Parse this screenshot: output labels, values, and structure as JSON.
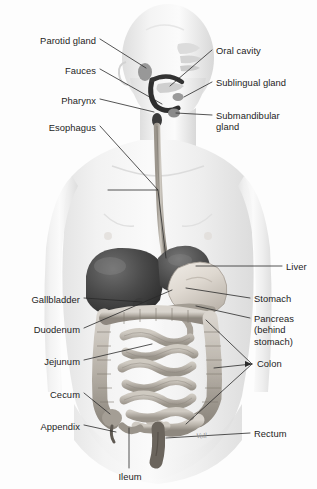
{
  "figure": {
    "artist_signature": "Voll",
    "background_color": "#fdfdfd",
    "leader_line_color": "#2a2a2a",
    "text_color": "#1d1d1d"
  },
  "labels_left": [
    {
      "id": "parotid-gland",
      "text": "Parotid gland",
      "x": 96,
      "y": 42
    },
    {
      "id": "fauces",
      "text": "Fauces",
      "x": 96,
      "y": 72
    },
    {
      "id": "pharynx",
      "text": "Pharynx",
      "x": 96,
      "y": 102
    },
    {
      "id": "esophagus",
      "text": "Esophagus",
      "x": 96,
      "y": 128
    },
    {
      "id": "gallbladder",
      "text": "Gallbladder",
      "x": 80,
      "y": 301
    },
    {
      "id": "duodenum",
      "text": "Duodenum",
      "x": 80,
      "y": 331
    },
    {
      "id": "jejunum",
      "text": "Jejunum",
      "x": 80,
      "y": 363
    },
    {
      "id": "cecum",
      "text": "Cecum",
      "x": 80,
      "y": 396
    },
    {
      "id": "appendix",
      "text": "Appendix",
      "x": 80,
      "y": 428
    }
  ],
  "labels_right": [
    {
      "id": "oral-cavity",
      "text": "Oral cavity",
      "x": 216,
      "y": 52
    },
    {
      "id": "sublingual-gland",
      "text": "Sublingual gland",
      "x": 216,
      "y": 84
    },
    {
      "id": "submandibular-gland",
      "text": "Submandibular\ngland",
      "x": 216,
      "y": 118
    },
    {
      "id": "liver",
      "text": "Liver",
      "x": 286,
      "y": 268
    },
    {
      "id": "stomach",
      "text": "Stomach",
      "x": 254,
      "y": 300
    },
    {
      "id": "pancreas",
      "text": "Pancreas\n(behind\nstomach)",
      "x": 254,
      "y": 320
    },
    {
      "id": "colon",
      "text": "Colon",
      "x": 257,
      "y": 365
    },
    {
      "id": "rectum",
      "text": "Rectum",
      "x": 254,
      "y": 435
    }
  ],
  "labels_bottom": [
    {
      "id": "ileum",
      "text": "Ileum",
      "x": 129,
      "y": 478
    }
  ],
  "organs": [
    "parotid gland",
    "oral cavity",
    "fauces",
    "sublingual gland",
    "pharynx",
    "submandibular gland",
    "esophagus",
    "liver",
    "gallbladder",
    "stomach",
    "pancreas",
    "duodenum",
    "jejunum",
    "colon",
    "cecum",
    "appendix",
    "ileum",
    "rectum"
  ]
}
